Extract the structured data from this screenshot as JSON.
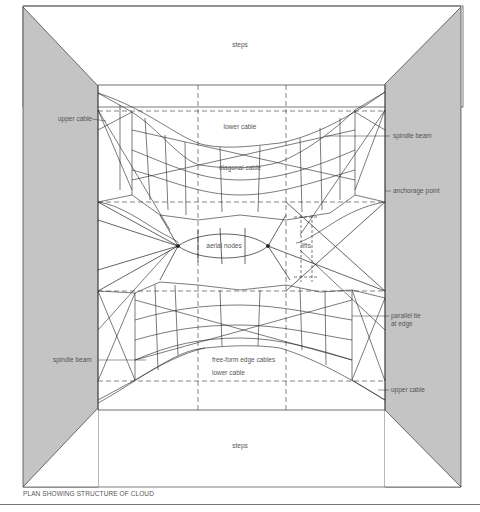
{
  "title": "PLAN SHOWING STRUCTURE OF CLOUD",
  "colors": {
    "wall": "#c4c4c4",
    "line": "#222222",
    "label": "#555555",
    "background": "#ffffff"
  },
  "labels": {
    "steps_top": "steps",
    "steps_bottom": "steps",
    "upper_cable_left": "upper cable",
    "upper_cable_right": "upper cable",
    "lower_cable_top": "lower cable",
    "lower_cable_bottom": "lower cable",
    "spindle_beam_top": "spindle beam",
    "spindle_beam_bottom": "spindle beam",
    "diagonal_cable": "diagonal cable",
    "anchorage_point": "anchorage point",
    "aerial_nodes": "aerial nodes",
    "lifts": "lifts",
    "parallel_tie_line1": "parallel tie",
    "parallel_tie_line2": "at edge",
    "free_form_edge_cables": "free-form edge cables"
  }
}
